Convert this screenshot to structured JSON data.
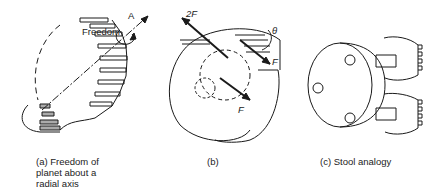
{
  "panels": [
    {
      "id": "a",
      "caption": [
        "(a) Freedom of",
        "planet about a",
        "radial axis"
      ],
      "labels": {
        "freedom": "Freedom",
        "axis": "A"
      }
    },
    {
      "id": "b",
      "caption": [
        "(b)"
      ],
      "labels": {
        "force_top": "2F",
        "force_right": "F",
        "force_bottom": "F",
        "angle": "θ"
      }
    },
    {
      "id": "c",
      "caption": [
        "(c) Stool analogy"
      ],
      "labels": {}
    }
  ],
  "colors": {
    "stroke": "#1a1a1a",
    "shade": "#888888"
  }
}
